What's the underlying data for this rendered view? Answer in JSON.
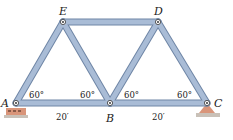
{
  "diagram": {
    "type": "truss",
    "colors": {
      "member_fill": "#a9bcd6",
      "member_edge": "#6f86a6",
      "support_fill": "#d9957a",
      "support_ground": "#c9c1b8",
      "text": "#222222"
    },
    "joints": [
      {
        "id": "A",
        "label": "A",
        "x": 16,
        "y": 103
      },
      {
        "id": "B",
        "label": "B",
        "x": 110,
        "y": 103
      },
      {
        "id": "C",
        "label": "C",
        "x": 207,
        "y": 103
      },
      {
        "id": "D",
        "label": "D",
        "x": 158,
        "y": 22
      },
      {
        "id": "E",
        "label": "E",
        "x": 63,
        "y": 22
      }
    ],
    "members": [
      [
        "A",
        "B"
      ],
      [
        "B",
        "C"
      ],
      [
        "E",
        "D"
      ],
      [
        "A",
        "E"
      ],
      [
        "E",
        "B"
      ],
      [
        "B",
        "D"
      ],
      [
        "D",
        "C"
      ]
    ],
    "angles": [
      {
        "at": "A",
        "label": "60°"
      },
      {
        "at": "B-left",
        "label": "60°"
      },
      {
        "at": "B-right",
        "label": "60°"
      },
      {
        "at": "C",
        "label": "60°"
      }
    ],
    "dimensions": [
      {
        "span": "A-B",
        "label": "20′"
      },
      {
        "span": "B-C",
        "label": "20′"
      }
    ],
    "supports": [
      {
        "at": "A",
        "type": "roller"
      },
      {
        "at": "C",
        "type": "pin"
      }
    ]
  }
}
